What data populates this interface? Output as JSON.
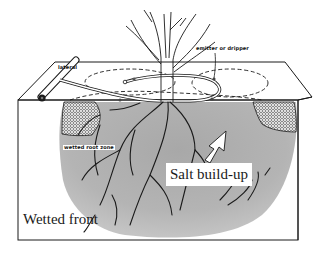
{
  "figure": {
    "type": "diagram",
    "labels": {
      "lateral": "lateral",
      "emitter": "emitter or dripper",
      "wetted_root_zone": "wetted root zone",
      "salt_buildup": "Salt build-up",
      "wetted_front": "Wetted front"
    },
    "colors": {
      "line": "#1a1a1a",
      "wetted_soil": "#b8b8b8",
      "wetted_soil_dark": "#9a9a9a",
      "background": "#ffffff",
      "salt_pattern": "#2a2a2a"
    }
  }
}
